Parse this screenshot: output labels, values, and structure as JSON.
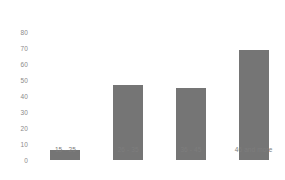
{
  "chart_data": {
    "type": "bar",
    "title": "",
    "subtitle": "",
    "xlabel": "",
    "ylabel": "",
    "categories": [
      "15 - 25",
      "26 - 35",
      "36 - 45",
      "46 and more"
    ],
    "values": [
      6,
      47,
      45,
      69
    ],
    "series": [
      {
        "name": "",
        "values": [
          6,
          47,
          45,
          69
        ]
      }
    ],
    "ylim": [
      0,
      80
    ],
    "yticks": [
      0,
      10,
      20,
      30,
      40,
      50,
      60,
      70,
      80
    ],
    "ytick_labels": [
      "0",
      "10",
      "20",
      "30",
      "40",
      "50",
      "60",
      "70",
      "80"
    ],
    "grid": false,
    "legend": false,
    "legend_position": "none",
    "bar_color": "#757575",
    "background_color": "#ffffff",
    "tick_label_color": "#8a8a8a",
    "annotations": []
  }
}
